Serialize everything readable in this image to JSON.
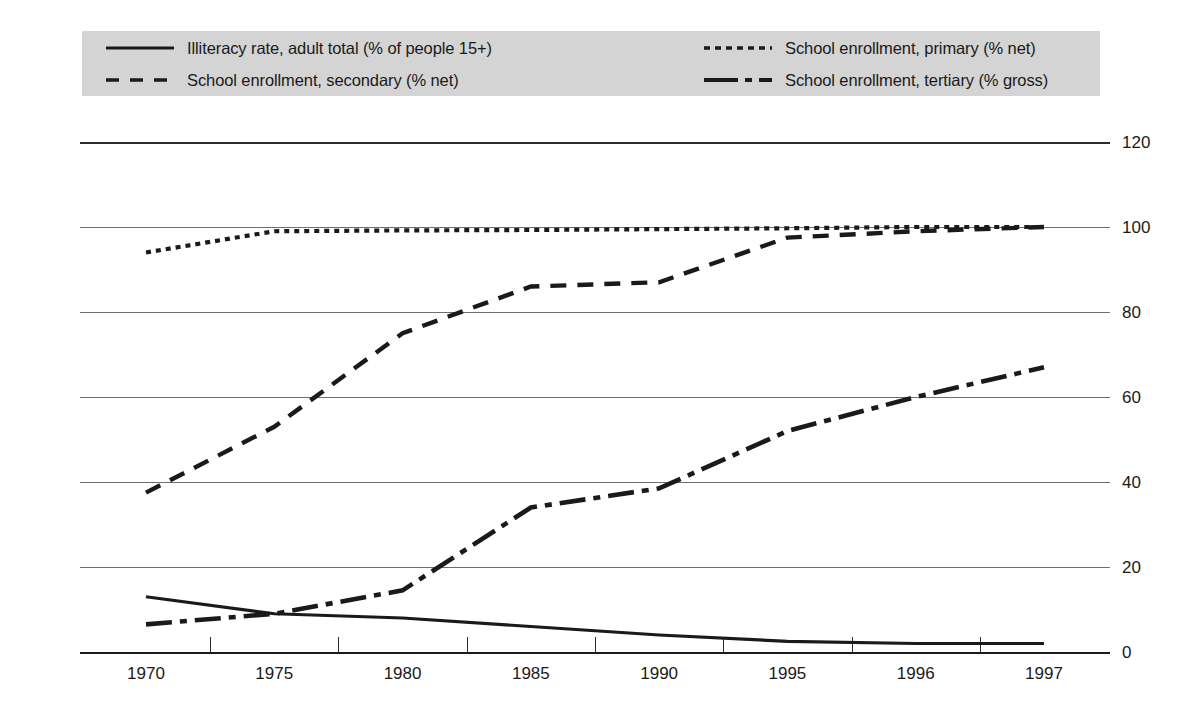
{
  "chart_data": {
    "type": "line",
    "title": "",
    "xlabel": "",
    "ylabel": "",
    "categories": [
      "1970",
      "1975",
      "1980",
      "1985",
      "1990",
      "1995",
      "1996",
      "1997"
    ],
    "x_tick_labels": [
      "1970",
      "1975",
      "1980",
      "1985",
      "1990",
      "1995",
      "1996",
      "1997"
    ],
    "y_tick_labels_left": [
      "120",
      "100",
      "80",
      "60",
      "40",
      "20",
      "0"
    ],
    "y_tick_labels_right": [
      "120",
      "100",
      "80",
      "60",
      "40",
      "20",
      "0"
    ],
    "y_ticks": [
      120,
      100,
      80,
      60,
      40,
      20,
      0
    ],
    "ylim": [
      0,
      120
    ],
    "grid": "horizontal",
    "legend_position": "top",
    "series": [
      {
        "name": "Illiteracy rate, adult total (% of people 15+)",
        "style": "solid",
        "dash": "none",
        "color": "#1a1a1a",
        "values": [
          13,
          9,
          8,
          6,
          4,
          2.5,
          2,
          2
        ]
      },
      {
        "name": "School enrollment, primary (% net)",
        "style": "dotted",
        "dash": "5,5",
        "color": "#1a1a1a",
        "values": [
          94,
          99,
          99.2,
          99.3,
          99.5,
          99.7,
          100,
          100
        ]
      },
      {
        "name": "School enrollment, secondary (% net)",
        "style": "dashed",
        "dash": "16,11",
        "color": "#1a1a1a",
        "values": [
          37.5,
          53,
          75,
          86,
          87,
          97.5,
          99,
          100
        ]
      },
      {
        "name": "School enrollment, tertiary (% gross)",
        "style": "dash-dot",
        "dash": "26,8,7,8",
        "color": "#1a1a1a",
        "values": [
          6.5,
          9,
          14.5,
          34,
          38.5,
          52,
          60,
          67
        ]
      }
    ]
  },
  "legend": {
    "entries": [
      {
        "label": "Illiteracy rate, adult total (% of people 15+)",
        "swatch": "solid-line-swatch"
      },
      {
        "label": "School enrollment, primary (% net)",
        "swatch": "dotted-line-swatch"
      },
      {
        "label": "School enrollment, secondary (% net)",
        "swatch": "dashed-line-swatch"
      },
      {
        "label": "School enrollment, tertiary (% gross)",
        "swatch": "dash-dot-line-swatch"
      }
    ],
    "background_color": "#d4d4d4"
  },
  "colors": {
    "ink": "#1a1a1a",
    "gridline": "#6e6e6e",
    "legend_bg": "#d4d4d4",
    "page_bg": "#ffffff"
  }
}
